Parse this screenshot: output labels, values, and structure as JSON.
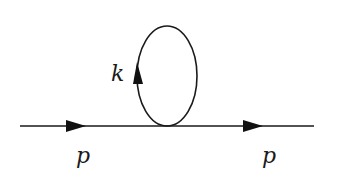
{
  "diagram": {
    "type": "feynman-diagram",
    "colors": {
      "line": "#1a1a1a",
      "background": "#ffffff"
    },
    "labels": {
      "incoming_momentum": "p",
      "outgoing_momentum": "p",
      "loop_momentum": "k"
    },
    "elements": {
      "propagator_line": {
        "x1": 20,
        "x2": 314,
        "y": 126
      },
      "loop": {
        "cx": 167,
        "cy": 76,
        "rx": 30,
        "ry": 50
      },
      "arrows": [
        {
          "name": "incoming-arrow",
          "direction": "right",
          "x": 66,
          "y": 126
        },
        {
          "name": "outgoing-arrow",
          "direction": "right",
          "x": 243,
          "y": 126
        },
        {
          "name": "loop-arrow",
          "direction": "up",
          "x": 137,
          "y": 64
        }
      ]
    }
  }
}
